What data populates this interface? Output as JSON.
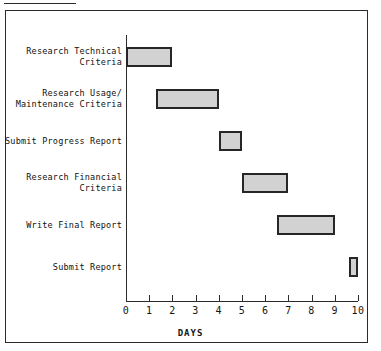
{
  "chart_data": {
    "type": "bar",
    "orientation": "horizontal",
    "subtype": "gantt",
    "title": "",
    "xlabel": "DAYS",
    "ylabel": "",
    "xlim": [
      0,
      10
    ],
    "xticks": [
      "0",
      "1",
      "2",
      "3",
      "4",
      "5",
      "6",
      "7",
      "8",
      "9",
      "10"
    ],
    "grid": false,
    "legend": "none",
    "bar_fill_color": "#d2d2d2",
    "bar_border_color": "#262626",
    "axis_color": "#2b2b2b",
    "categories": [
      "Research Technical Criteria",
      "Research Usage/ Maintenance Criteria",
      "Submit Progress Report",
      "Research Financial Criteria",
      "Write Final Report",
      "Submit Report"
    ],
    "tasks": [
      {
        "label_line1": "Research Technical",
        "label_line2": "Criteria",
        "start": 0,
        "end": 2,
        "duration": 2
      },
      {
        "label_line1": "Research Usage/",
        "label_line2": "Maintenance Criteria",
        "start": 1.3,
        "end": 4,
        "duration": 2.7
      },
      {
        "label_line1": "Submit Progress Report",
        "label_line2": "",
        "start": 4,
        "end": 5,
        "duration": 1
      },
      {
        "label_line1": "Research Financial",
        "label_line2": "Criteria",
        "start": 5,
        "end": 7,
        "duration": 2
      },
      {
        "label_line1": "Write Final Report",
        "label_line2": "",
        "start": 6.5,
        "end": 9,
        "duration": 2.5
      },
      {
        "label_line1": "Submit Report",
        "label_line2": "",
        "start": 9.6,
        "end": 10,
        "duration": 0.4
      }
    ]
  }
}
